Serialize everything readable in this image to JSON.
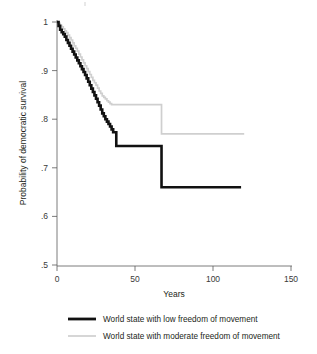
{
  "chart_data": {
    "type": "line",
    "title": "",
    "xlabel": "Years",
    "ylabel": "Probability of democratic survival",
    "xlim": [
      0,
      150
    ],
    "ylim": [
      0.5,
      1.0
    ],
    "xticks": [
      0,
      50,
      100,
      150
    ],
    "xticklabels": [
      "0",
      "50",
      "100",
      "150"
    ],
    "yticks": [
      0.5,
      0.6,
      0.7,
      0.8,
      0.9,
      1.0
    ],
    "yticklabels": [
      ".5",
      ".6",
      ".7",
      ".8",
      ".9",
      "1"
    ],
    "grid": false,
    "legend_position": "below",
    "step_type": "post",
    "series": [
      {
        "name": "World state with low freedom of movement",
        "color": "#111111",
        "linewidth": "thick",
        "x": [
          0,
          1,
          2,
          3,
          4,
          5,
          6,
          7,
          8,
          9,
          10,
          11,
          12,
          13,
          14,
          15,
          16,
          17,
          18,
          19,
          20,
          21,
          22,
          23,
          24,
          25,
          26,
          27,
          28,
          29,
          30,
          31,
          32,
          33,
          34,
          35,
          36,
          37,
          38,
          67,
          118
        ],
        "y": [
          1.0,
          0.992,
          0.984,
          0.979,
          0.975,
          0.97,
          0.963,
          0.957,
          0.951,
          0.945,
          0.939,
          0.933,
          0.927,
          0.921,
          0.915,
          0.909,
          0.903,
          0.897,
          0.891,
          0.884,
          0.877,
          0.87,
          0.863,
          0.856,
          0.849,
          0.842,
          0.835,
          0.828,
          0.82,
          0.812,
          0.806,
          0.8,
          0.795,
          0.79,
          0.785,
          0.779,
          0.773,
          0.773,
          0.745,
          0.66,
          0.66
        ]
      },
      {
        "name": "World state with moderate freedom of movement",
        "color": "#cfcfcf",
        "linewidth": "thin",
        "x": [
          0,
          1,
          2,
          3,
          4,
          5,
          6,
          7,
          8,
          9,
          10,
          11,
          12,
          13,
          14,
          15,
          16,
          17,
          18,
          19,
          20,
          21,
          22,
          23,
          24,
          25,
          26,
          27,
          28,
          29,
          30,
          31,
          32,
          33,
          34,
          35,
          40,
          67,
          120
        ],
        "y": [
          1.0,
          0.997,
          0.993,
          0.99,
          0.986,
          0.982,
          0.978,
          0.973,
          0.968,
          0.963,
          0.957,
          0.951,
          0.946,
          0.94,
          0.934,
          0.928,
          0.922,
          0.916,
          0.91,
          0.904,
          0.898,
          0.892,
          0.886,
          0.88,
          0.875,
          0.87,
          0.864,
          0.858,
          0.853,
          0.848,
          0.845,
          0.842,
          0.838,
          0.835,
          0.832,
          0.83,
          0.83,
          0.77,
          0.77
        ]
      }
    ]
  },
  "legend": {
    "entries": [
      {
        "label": "World state with low freedom of movement",
        "swatch": "thick-black-line-icon"
      },
      {
        "label": "World state with moderate freedom of movement",
        "swatch": "thin-gray-line-icon"
      }
    ]
  }
}
